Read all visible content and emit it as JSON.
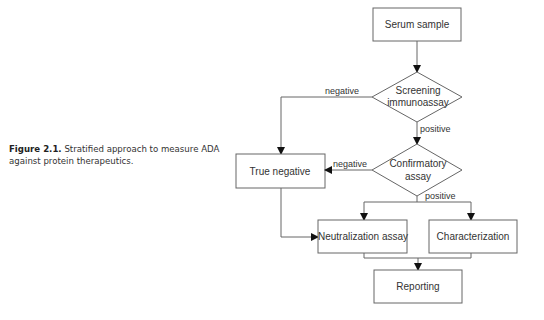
{
  "caption": {
    "figure_label": "Figure 2.1.",
    "text": "Stratified approach to measure ADA against protein therapeutics."
  },
  "diagram": {
    "nodes": {
      "serum_sample": {
        "label": "Serum sample",
        "shape": "rect"
      },
      "screening": {
        "line1": "Screening",
        "line2": "immunoassay",
        "shape": "diamond"
      },
      "true_negative": {
        "label": "True negative",
        "shape": "rect"
      },
      "confirmatory": {
        "line1": "Confirmatory",
        "line2": "assay",
        "shape": "diamond"
      },
      "neutralization": {
        "label": "Neutralization assay",
        "shape": "rect"
      },
      "characterization": {
        "label": "Characterization",
        "shape": "rect"
      },
      "reporting": {
        "label": "Reporting",
        "shape": "rect"
      }
    },
    "edge_labels": {
      "screening_negative": "negative",
      "screening_positive": "positive",
      "confirmatory_negative": "negative",
      "confirmatory_positive": "positive"
    },
    "colors": {
      "stroke": "#555555",
      "text": "#333333"
    }
  }
}
